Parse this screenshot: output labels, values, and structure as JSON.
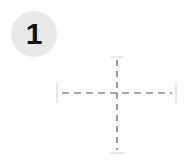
{
  "badge": {
    "label": "1",
    "background": "#e9e9e9",
    "text_color": "#111111"
  },
  "crosshair": {
    "stroke": "#555555",
    "cap_stroke": "#cccccc",
    "center": {
      "x": 117,
      "y": 93
    },
    "vertical": {
      "y1": 57,
      "y2": 152
    },
    "horizontal": {
      "x1": 58,
      "x2": 176
    }
  }
}
